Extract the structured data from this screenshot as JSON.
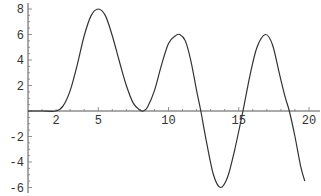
{
  "chart_data": {
    "type": "line",
    "title": "",
    "xlabel": "",
    "ylabel": "",
    "xlim": [
      0,
      20
    ],
    "ylim": [
      -6.2,
      8.2
    ],
    "grid": false,
    "legend": null,
    "x_ticks": [
      2,
      5,
      10,
      15,
      20
    ],
    "x_tick_labels": [
      "2",
      "5",
      "10",
      "15",
      "20"
    ],
    "y_ticks": [
      -6,
      -4,
      -2,
      2,
      4,
      6,
      8
    ],
    "y_tick_labels": [
      "-6",
      "-4",
      "-2",
      "2",
      "4",
      "6",
      "8"
    ],
    "series": [
      {
        "name": "f(x)",
        "color": "#333333",
        "x": [
          0,
          1,
          2,
          2.5,
          3,
          3.5,
          4,
          4.5,
          5,
          5.5,
          6,
          6.5,
          7,
          7.5,
          8,
          8.2,
          8.5,
          9,
          9.5,
          10,
          10.5,
          10.8,
          11.2,
          11.6,
          12,
          12.3,
          12.7,
          13.2,
          13.7,
          14.2,
          14.7,
          15.3,
          15.8,
          16.3,
          16.9,
          17.4,
          17.9,
          18.3,
          18.6,
          19,
          19.4,
          19.7
        ],
        "values": [
          0,
          0,
          0,
          0.4,
          1.6,
          3.6,
          5.9,
          7.5,
          8,
          7.5,
          5.9,
          3.9,
          2.0,
          0.6,
          0.05,
          0,
          0.3,
          1.6,
          3.6,
          5.3,
          5.9,
          6,
          5.5,
          3.9,
          1.6,
          0,
          -2.4,
          -5.0,
          -6,
          -5.2,
          -3.1,
          0,
          2.8,
          5.0,
          6,
          5.2,
          2.9,
          1.1,
          0,
          -2.0,
          -4.3,
          -5.5
        ]
      }
    ]
  }
}
